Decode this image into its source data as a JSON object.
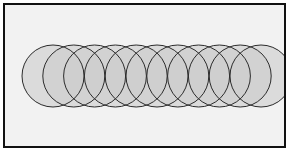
{
  "figure": {
    "frame": {
      "x": 3,
      "y": 3,
      "width": 283,
      "height": 145,
      "border_width": 2,
      "border_color": "#111111",
      "background_color": "#f2f2f2"
    },
    "canvas": {
      "width": 292,
      "height": 156,
      "background_color": "#ffffff"
    }
  },
  "chart_data": {
    "type": "scatter",
    "xlabel": "",
    "ylabel": "",
    "xlim": [
      3,
      286
    ],
    "ylim": [
      3,
      148
    ],
    "grid": false,
    "legend": "none",
    "shape": "circle",
    "count": 11,
    "radius": 31,
    "center_y": 76,
    "spacing": 20.8,
    "fill_color": "#cdcdcd",
    "stroke_color": "#2b2b2b",
    "stroke_width": 1,
    "fill_opacity": 0.62,
    "x": [
      53,
      73.8,
      94.6,
      115.4,
      136.2,
      157,
      177.8,
      198.6,
      219.4,
      240.2,
      261
    ],
    "y": [
      76,
      76,
      76,
      76,
      76,
      76,
      76,
      76,
      76,
      76,
      76
    ],
    "circles": [
      {
        "label": "circle-1",
        "cx": 53,
        "cy": 76,
        "r": 31
      },
      {
        "label": "circle-2",
        "cx": 73.8,
        "cy": 76,
        "r": 31
      },
      {
        "label": "circle-3",
        "cx": 94.6,
        "cy": 76,
        "r": 31
      },
      {
        "label": "circle-4",
        "cx": 115.4,
        "cy": 76,
        "r": 31
      },
      {
        "label": "circle-5",
        "cx": 136.2,
        "cy": 76,
        "r": 31
      },
      {
        "label": "circle-6",
        "cx": 157,
        "cy": 76,
        "r": 31
      },
      {
        "label": "circle-7",
        "cx": 177.8,
        "cy": 76,
        "r": 31
      },
      {
        "label": "circle-8",
        "cx": 198.6,
        "cy": 76,
        "r": 31
      },
      {
        "label": "circle-9",
        "cx": 219.4,
        "cy": 76,
        "r": 31
      },
      {
        "label": "circle-10",
        "cx": 240.2,
        "cy": 76,
        "r": 31
      },
      {
        "label": "circle-11",
        "cx": 261,
        "cy": 76,
        "r": 31
      }
    ]
  }
}
